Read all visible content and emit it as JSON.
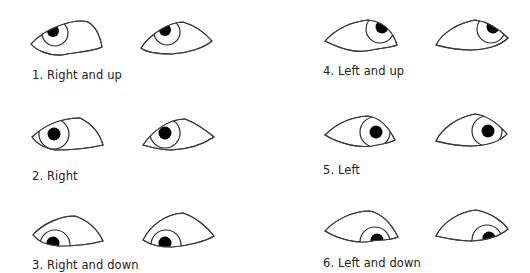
{
  "figure": {
    "panels": [
      {
        "id": 1,
        "label": "1. Right and up",
        "direction": "right-up"
      },
      {
        "id": 2,
        "label": "2. Right",
        "direction": "right"
      },
      {
        "id": 3,
        "label": "3. Right and down",
        "direction": "right-down"
      },
      {
        "id": 4,
        "label": "4. Left and up",
        "direction": "left-up"
      },
      {
        "id": 5,
        "label": "5. Left",
        "direction": "left"
      },
      {
        "id": 6,
        "label": "6. Left and down",
        "direction": "left-down"
      }
    ],
    "colors": {
      "outline": "#3a3a3a",
      "pupil": "#000000",
      "background": "#ffffff",
      "text": "#222222"
    }
  }
}
